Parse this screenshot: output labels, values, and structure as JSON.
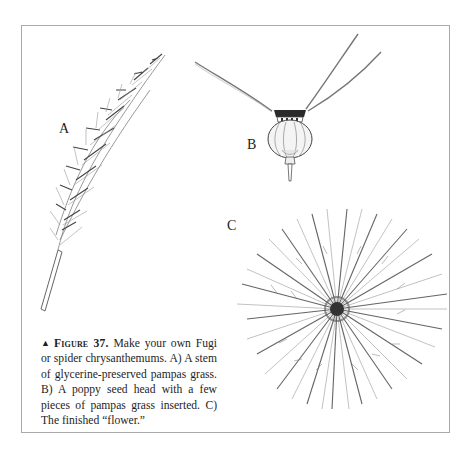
{
  "figure": {
    "marker": "▲",
    "number_label": "Figure 37.",
    "caption_text": " Make your own Fugi or spider chrysanthemums. A) A stem of glycerine-preserved pampas grass. B) A poppy seed head with a few pieces of pampas grass inserted. C) The finished “flower.”"
  },
  "panels": [
    {
      "id": "A",
      "label": "A",
      "description": "Stem of glycerine-preserved pampas grass"
    },
    {
      "id": "B",
      "label": "B",
      "description": "Poppy seed head with pampas grass pieces inserted"
    },
    {
      "id": "C",
      "label": "C",
      "description": "The finished flower"
    }
  ],
  "colors": {
    "frame": "#a9a9a9",
    "ink": "#1c1c1c",
    "sketch": "#555555"
  }
}
